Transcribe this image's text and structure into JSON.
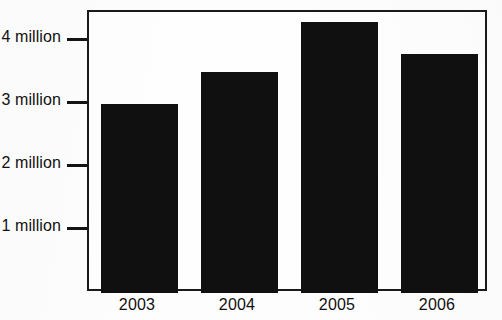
{
  "chart_data": {
    "type": "bar",
    "title": "",
    "subtitle": "",
    "xlabel": "",
    "ylabel": "",
    "categories": [
      "2003",
      "2004",
      "2005",
      "2006"
    ],
    "values": [
      3000000,
      3500000,
      4300000,
      3800000
    ],
    "value_labels": [
      "3 million",
      "3.5 million",
      "4.3 million",
      "3.8 million"
    ],
    "ylim": [
      0,
      4460000
    ],
    "yticks": [
      1000000,
      2000000,
      3000000,
      4000000
    ],
    "ytick_labels": [
      "1 million",
      "2 million",
      "3 million",
      "4 million"
    ],
    "grid": false,
    "legend": null,
    "legend_position": "none",
    "annotations": [],
    "colors": {
      "bar": "#101010",
      "frame": "#1a1a1a",
      "text": "#111111",
      "plot_background": "#fefefe",
      "page_background": "#fdfdfd"
    }
  }
}
